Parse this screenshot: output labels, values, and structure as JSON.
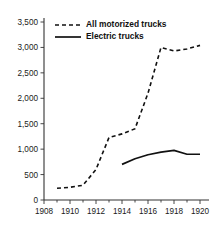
{
  "chart_data": {
    "type": "line",
    "title": "",
    "subtitle": "",
    "xlabel": "",
    "ylabel": "",
    "xlim": [
      1908,
      1920.5
    ],
    "ylim": [
      0,
      3500
    ],
    "grid": false,
    "legend_position": "top-left-inside",
    "x_ticks": [
      "1908",
      "1910",
      "1912",
      "1914",
      "1916",
      "1918",
      "1920"
    ],
    "x_tick_values": [
      1908,
      1910,
      1912,
      1914,
      1916,
      1918,
      1920
    ],
    "x_minor_tick_values": [
      1909,
      1911,
      1913,
      1915,
      1917,
      1919
    ],
    "y_ticks": [
      "0",
      "500",
      "1,000",
      "1,500",
      "2,000",
      "2,500",
      "3,000",
      "3,500"
    ],
    "y_tick_values": [
      0,
      500,
      1000,
      1500,
      2000,
      2500,
      3000,
      3500
    ],
    "series": [
      {
        "name": "All motorized trucks",
        "style": "dashed",
        "color": "#111111",
        "x": [
          1909,
          1910,
          1911,
          1912,
          1913,
          1914,
          1915,
          1916,
          1917,
          1918,
          1919,
          1920
        ],
        "values": [
          230,
          250,
          290,
          600,
          1230,
          1300,
          1400,
          2100,
          3000,
          2930,
          2970,
          3040
        ]
      },
      {
        "name": "Electric trucks",
        "style": "solid",
        "color": "#111111",
        "x": [
          1914,
          1915,
          1916,
          1917,
          1918,
          1919,
          1920
        ],
        "values": [
          700,
          810,
          890,
          940,
          975,
          900,
          900
        ]
      }
    ],
    "legend": [
      {
        "label": "All motorized trucks",
        "style": "dashed"
      },
      {
        "label": "Electric trucks",
        "style": "solid"
      }
    ]
  },
  "colors": {
    "background": "#ffffff",
    "ink": "#111111",
    "axis": "#333333"
  }
}
